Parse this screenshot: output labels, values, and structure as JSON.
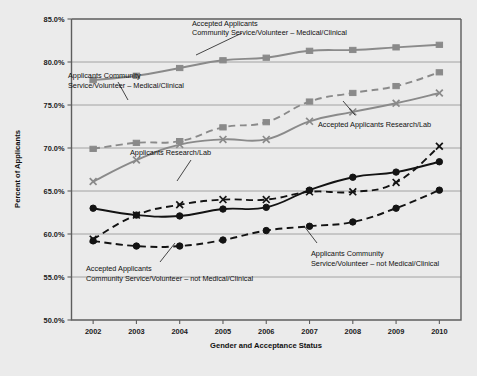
{
  "figure": {
    "background_color": "#ebebeb",
    "plot_background_color": "#ebebeb",
    "grid_color": "#9a9a9a",
    "frame_color": "#5d5d5d",
    "gray_series_color": "#8a8a8a",
    "black_series_color": "#131313"
  },
  "axis": {
    "y_label": "Percent of Applicants",
    "x_label": "Gender and Acceptance Status",
    "y_ticks": [
      "50.0%",
      "55.0%",
      "60.0%",
      "65.0%",
      "70.0%",
      "75.0%",
      "80.0%",
      "85.0%"
    ],
    "x_ticks": [
      "2002",
      "2003",
      "2004",
      "2005",
      "2006",
      "2007",
      "2008",
      "2009",
      "2010"
    ]
  },
  "annotations": [
    {
      "id": "acc-cs-med",
      "line1": "Accepted Applicants",
      "line2": "Community Service/Volunteer – Medical/Clinical"
    },
    {
      "id": "app-cs-med",
      "line1": "Applicants Community",
      "line2": "Service/Volunteer – Medical/Clinical"
    },
    {
      "id": "acc-research",
      "line1": "Accepted Applicants Research/Lab",
      "line2": ""
    },
    {
      "id": "app-research",
      "line1": "Applicants Research/Lab",
      "line2": ""
    },
    {
      "id": "acc-cs-notmed",
      "line1": "Accepted Applicants",
      "line2": "Community Service/Volunteer – not Medical/Clinical"
    },
    {
      "id": "app-cs-notmed",
      "line1": "Applicants Community",
      "line2": "Service/Volunteer – not Medical/Clinical"
    }
  ],
  "chart_data": {
    "type": "line",
    "title": "",
    "xlabel": "Gender and Acceptance Status",
    "ylabel": "Percent of Applicants",
    "categories": [
      2002,
      2003,
      2004,
      2005,
      2006,
      2007,
      2008,
      2009,
      2010
    ],
    "ylim": [
      50.0,
      85.0
    ],
    "ytick_step": 5.0,
    "grid": true,
    "legend": "annotations-inline",
    "series": [
      {
        "name": "Accepted Applicants Community Service/Volunteer – Medical/Clinical",
        "color": "#8a8a8a",
        "style": "solid",
        "marker": "square",
        "values": [
          77.9,
          78.4,
          79.3,
          80.2,
          80.5,
          81.3,
          81.4,
          81.7,
          82.0
        ]
      },
      {
        "name": "Applicants Community Service/Volunteer – Medical/Clinical",
        "color": "#8a8a8a",
        "style": "dashed",
        "marker": "square",
        "values": [
          69.9,
          70.6,
          70.8,
          72.4,
          73.0,
          75.4,
          76.4,
          77.2,
          78.8
        ]
      },
      {
        "name": "Accepted Applicants Research/Lab",
        "color": "#8a8a8a",
        "style": "solid",
        "marker": "cross",
        "values": [
          66.1,
          68.6,
          70.4,
          71.0,
          71.0,
          73.1,
          74.2,
          75.2,
          76.4
        ]
      },
      {
        "name": "Applicants Research/Lab",
        "color": "#131313",
        "style": "dashed",
        "marker": "cross",
        "values": [
          59.4,
          62.2,
          63.4,
          64.0,
          64.0,
          64.9,
          64.9,
          66.0,
          70.2
        ]
      },
      {
        "name": "Accepted Applicants not Medical/Clinical (solid black)",
        "color": "#131313",
        "style": "solid",
        "marker": "circle",
        "values": [
          63.0,
          62.2,
          62.1,
          62.9,
          63.1,
          65.1,
          66.6,
          67.2,
          68.4
        ]
      },
      {
        "name": "Applicants Community Service/Volunteer – not Medical/Clinical",
        "color": "#131313",
        "style": "dashed",
        "marker": "circle",
        "values": [
          59.2,
          58.6,
          58.6,
          59.3,
          60.4,
          60.9,
          61.4,
          63.0,
          65.1
        ]
      }
    ]
  }
}
